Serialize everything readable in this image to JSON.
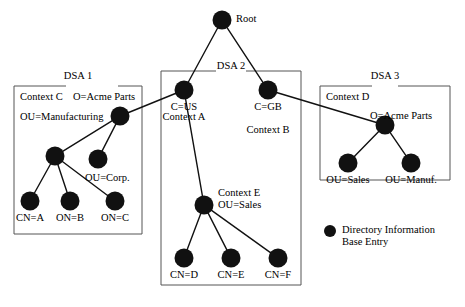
{
  "diagram": {
    "type": "tree-diagram",
    "canvas": {
      "width": 465,
      "height": 307
    },
    "colors": {
      "node_fill": "#111111",
      "edge": "#111111",
      "box_stroke": "#555555",
      "background": "#ffffff",
      "text": "#000000"
    },
    "boxes": [
      {
        "id": "dsa1",
        "title": "DSA 1",
        "title_x": 78,
        "title_y": 70,
        "x": 14,
        "y": 86,
        "width": 128,
        "height": 148,
        "gap_start": 52,
        "gap_end": 104
      },
      {
        "id": "dsa2",
        "title": "DSA 2",
        "title_x": 231,
        "title_y": 60,
        "x": 161,
        "y": 71,
        "width": 140,
        "height": 214,
        "gap_start": 55,
        "gap_end": 85
      },
      {
        "id": "dsa3",
        "title": "DSA 3",
        "title_x": 385,
        "title_y": 70,
        "x": 320,
        "y": 86,
        "width": 130,
        "height": 94,
        "gap_start": 52,
        "gap_end": 78
      }
    ],
    "nodes": [
      {
        "id": "root",
        "label": "Root",
        "x": 222,
        "y": 20,
        "r": 9.5,
        "label_x": 236,
        "label_y": 13,
        "align": "left"
      },
      {
        "id": "cus",
        "label": "C=US",
        "x": 184,
        "y": 90,
        "r": 9.5,
        "label_x": 184,
        "label_y": 101,
        "align": "center"
      },
      {
        "id": "cgb",
        "label": "C=GB",
        "x": 268,
        "y": 90,
        "r": 9.5,
        "label_x": 268,
        "label_y": 101,
        "align": "center"
      },
      {
        "id": "ou_manu",
        "label": "OU=Manufacturing",
        "x": 120,
        "y": 116,
        "r": 9.5,
        "label_x": 20,
        "label_y": 111,
        "align": "left"
      },
      {
        "id": "mid1",
        "label": "",
        "x": 55,
        "y": 156,
        "r": 9.5,
        "label_x": 0,
        "label_y": 0,
        "align": "none"
      },
      {
        "id": "ou_corp",
        "label": "OU=Corp.",
        "x": 98,
        "y": 159,
        "r": 9.5,
        "label_x": 85,
        "label_y": 172,
        "align": "left"
      },
      {
        "id": "cn_a",
        "label": "CN=A",
        "x": 30,
        "y": 201,
        "r": 9.5,
        "label_x": 30,
        "label_y": 212,
        "align": "center"
      },
      {
        "id": "on_b",
        "label": "ON=B",
        "x": 70,
        "y": 201,
        "r": 9.5,
        "label_x": 70,
        "label_y": 212,
        "align": "center"
      },
      {
        "id": "on_c",
        "label": "ON=C",
        "x": 115,
        "y": 201,
        "r": 9.5,
        "label_x": 115,
        "label_y": 212,
        "align": "center"
      },
      {
        "id": "ou_sales_e",
        "label": "OU=Sales",
        "x": 204,
        "y": 205,
        "r": 9.5,
        "label_x": 218,
        "label_y": 199,
        "align": "left"
      },
      {
        "id": "cn_d",
        "label": "CN=D",
        "x": 184,
        "y": 258,
        "r": 9.5,
        "label_x": 184,
        "label_y": 269,
        "align": "center"
      },
      {
        "id": "cn_e",
        "label": "CN=E",
        "x": 231,
        "y": 258,
        "r": 9.5,
        "label_x": 231,
        "label_y": 269,
        "align": "center"
      },
      {
        "id": "cn_f",
        "label": "CN=F",
        "x": 278,
        "y": 258,
        "r": 9.5,
        "label_x": 278,
        "label_y": 269,
        "align": "center"
      },
      {
        "id": "o_acme_d3",
        "label": "O=Acme Parts",
        "x": 385,
        "y": 125,
        "r": 9.5,
        "label_x": 370,
        "label_y": 110,
        "align": "left"
      },
      {
        "id": "ou_sales3",
        "label": "OU=Sales",
        "x": 348,
        "y": 163,
        "r": 9.5,
        "label_x": 348,
        "label_y": 174,
        "align": "center"
      },
      {
        "id": "ou_manuf3",
        "label": "OU=Manuf.",
        "x": 411,
        "y": 163,
        "r": 9.5,
        "label_x": 411,
        "label_y": 174,
        "align": "center"
      }
    ],
    "edges": [
      {
        "from": "root",
        "to": "cus"
      },
      {
        "from": "root",
        "to": "cgb"
      },
      {
        "from": "cus",
        "to": "ou_manu"
      },
      {
        "from": "cus",
        "to": "ou_sales_e"
      },
      {
        "from": "cgb",
        "to": "o_acme_d3"
      },
      {
        "from": "ou_manu",
        "to": "mid1"
      },
      {
        "from": "ou_manu",
        "to": "ou_corp"
      },
      {
        "from": "mid1",
        "to": "cn_a"
      },
      {
        "from": "mid1",
        "to": "on_b"
      },
      {
        "from": "mid1",
        "to": "on_c"
      },
      {
        "from": "ou_sales_e",
        "to": "cn_d"
      },
      {
        "from": "ou_sales_e",
        "to": "cn_e"
      },
      {
        "from": "ou_sales_e",
        "to": "cn_f"
      },
      {
        "from": "o_acme_d3",
        "to": "ou_sales3"
      },
      {
        "from": "o_acme_d3",
        "to": "ou_manuf3"
      }
    ],
    "annotations": [
      {
        "id": "context_c",
        "text": "Context C",
        "x": 20,
        "y": 91,
        "align": "left"
      },
      {
        "id": "o_acme_dsa1",
        "text": "O=Acme Parts",
        "x": 73,
        "y": 91,
        "align": "left"
      },
      {
        "id": "context_a",
        "text": "Context A",
        "x": 184,
        "y": 111,
        "align": "center"
      },
      {
        "id": "context_b",
        "text": "Context B",
        "x": 268,
        "y": 124,
        "align": "center"
      },
      {
        "id": "context_d",
        "text": "Context D",
        "x": 326,
        "y": 91,
        "align": "left"
      },
      {
        "id": "context_e",
        "text": "Context E",
        "x": 218,
        "y": 187,
        "align": "left"
      }
    ],
    "legend": {
      "dot_x": 330,
      "dot_y": 231,
      "dot_r": 6,
      "line1": "Directory Information",
      "line2": "Base Entry",
      "text_x": 342,
      "text_y": 224
    }
  }
}
